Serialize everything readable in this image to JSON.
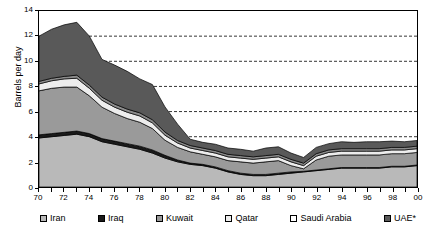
{
  "chart_data": {
    "type": "area",
    "stacked": true,
    "title": "",
    "xlabel": "",
    "ylabel": "Barrels per day",
    "ylim": [
      0,
      14
    ],
    "ytick_values": [
      0,
      2,
      4,
      6,
      8,
      10,
      12,
      14
    ],
    "ytick_labels": [
      "0",
      "2",
      "4",
      "6",
      "8",
      "10",
      "12",
      "14"
    ],
    "grid": "horizontal-dashed",
    "legend_position": "bottom",
    "x": [
      1970,
      1971,
      1972,
      1973,
      1974,
      1975,
      1976,
      1977,
      1978,
      1979,
      1980,
      1981,
      1982,
      1983,
      1984,
      1985,
      1986,
      1987,
      1988,
      1989,
      1990,
      1991,
      1992,
      1993,
      1994,
      1995,
      1996,
      1997,
      1998,
      1999,
      2000
    ],
    "xtick_labels": [
      "70",
      "72",
      "74",
      "76",
      "78",
      "80",
      "82",
      "84",
      "86",
      "88",
      "90",
      "92",
      "94",
      "96",
      "98",
      "00"
    ],
    "xtick_values": [
      1970,
      1972,
      1974,
      1976,
      1978,
      1980,
      1982,
      1984,
      1986,
      1988,
      1990,
      1992,
      1994,
      1996,
      1998,
      2000
    ],
    "series": [
      {
        "name": "Iran",
        "color": "#b9b9b9",
        "values": [
          3.9,
          4.0,
          4.1,
          4.2,
          4.0,
          3.6,
          3.4,
          3.2,
          3.0,
          2.7,
          2.3,
          2.0,
          1.8,
          1.7,
          1.5,
          1.2,
          1.0,
          0.9,
          0.9,
          1.0,
          1.1,
          1.2,
          1.3,
          1.4,
          1.5,
          1.5,
          1.5,
          1.5,
          1.6,
          1.6,
          1.7
        ]
      },
      {
        "name": "Iraq",
        "color": "#1a1a1a",
        "values": [
          0.25,
          0.25,
          0.25,
          0.25,
          0.25,
          0.25,
          0.25,
          0.25,
          0.25,
          0.25,
          0.22,
          0.15,
          0.1,
          0.1,
          0.1,
          0.1,
          0.1,
          0.1,
          0.1,
          0.1,
          0.1,
          0.05,
          0.05,
          0.05,
          0.05,
          0.05,
          0.05,
          0.05,
          0.05,
          0.05,
          0.05
        ]
      },
      {
        "name": "Kuwait",
        "color": "#9a9a9a",
        "values": [
          3.5,
          3.6,
          3.6,
          3.5,
          3.0,
          2.5,
          2.2,
          2.0,
          1.9,
          1.7,
          1.2,
          1.0,
          0.9,
          0.8,
          0.8,
          0.8,
          0.9,
          0.9,
          1.0,
          1.0,
          0.5,
          0.2,
          0.8,
          1.0,
          1.0,
          1.0,
          1.0,
          1.0,
          1.0,
          1.0,
          1.0
        ]
      },
      {
        "name": "Qatar",
        "color": "#ededed",
        "values": [
          0.55,
          0.6,
          0.65,
          0.7,
          0.6,
          0.55,
          0.5,
          0.5,
          0.5,
          0.45,
          0.4,
          0.35,
          0.3,
          0.3,
          0.3,
          0.3,
          0.3,
          0.3,
          0.3,
          0.3,
          0.3,
          0.25,
          0.3,
          0.3,
          0.3,
          0.3,
          0.3,
          0.3,
          0.3,
          0.3,
          0.3
        ]
      },
      {
        "name": "Saudi Arabia",
        "color": "#8c8c8c",
        "values": [
          0.2,
          0.2,
          0.2,
          0.25,
          0.25,
          0.25,
          0.25,
          0.25,
          0.25,
          0.25,
          0.25,
          0.2,
          0.2,
          0.2,
          0.2,
          0.2,
          0.2,
          0.2,
          0.2,
          0.2,
          0.2,
          0.2,
          0.2,
          0.2,
          0.2,
          0.2,
          0.2,
          0.2,
          0.2,
          0.2,
          0.2
        ]
      },
      {
        "name": "UAE*",
        "color": "#595959",
        "values": [
          3.6,
          3.9,
          4.1,
          4.2,
          3.9,
          3.0,
          3.1,
          3.0,
          2.7,
          2.8,
          2.0,
          1.3,
          0.5,
          0.45,
          0.5,
          0.5,
          0.5,
          0.45,
          0.6,
          0.6,
          0.5,
          0.45,
          0.5,
          0.5,
          0.55,
          0.5,
          0.55,
          0.55,
          0.5,
          0.45,
          0.45
        ]
      }
    ]
  },
  "legend": {
    "items": [
      {
        "label": "Iran",
        "color": "#b9b9b9"
      },
      {
        "label": "Iraq",
        "color": "#1a1a1a"
      },
      {
        "label": "Kuwait",
        "color": "#9a9a9a"
      },
      {
        "label": "Qatar",
        "color": "#ededed"
      },
      {
        "label": "Saudi Arabia",
        "color": "#ffffff"
      },
      {
        "label": "UAE*",
        "color": "#595959"
      }
    ]
  }
}
